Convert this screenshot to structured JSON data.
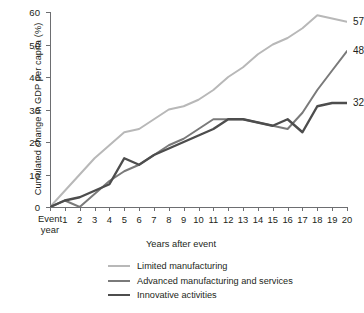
{
  "chart_data": {
    "type": "line",
    "title": "",
    "xlabel": "Years after event",
    "ylabel": "Cumulated change in GDP per capita (%)",
    "xlim": [
      0,
      20
    ],
    "ylim": [
      0,
      60
    ],
    "grid": false,
    "legend_position": "bottom",
    "x": [
      0,
      1,
      2,
      3,
      4,
      5,
      6,
      7,
      8,
      9,
      10,
      11,
      12,
      13,
      14,
      15,
      16,
      17,
      18,
      19,
      20
    ],
    "xtick_labels": [
      "Event year",
      "1",
      "2",
      "3",
      "4",
      "5",
      "6",
      "7",
      "8",
      "9",
      "10",
      "11",
      "12",
      "13",
      "14",
      "15",
      "16",
      "17",
      "18",
      "19",
      "20"
    ],
    "ytick_labels": [
      "0",
      "10",
      "20",
      "30",
      "40",
      "50",
      "60"
    ],
    "ytick_values": [
      0,
      10,
      20,
      30,
      40,
      50,
      60
    ],
    "series": [
      {
        "name": "Limited manufacturing",
        "color": "#b8b8b8",
        "width": 2.0,
        "end_label": "57",
        "values": [
          0,
          5,
          10,
          15,
          19,
          23,
          24,
          27,
          30,
          31,
          33,
          36,
          40,
          43,
          47,
          50,
          52,
          55,
          59,
          58,
          57
        ]
      },
      {
        "name": "Advanced manufacturing and services",
        "color": "#7a7a7a",
        "width": 2.0,
        "end_label": "48",
        "values": [
          0,
          2,
          0,
          4,
          8,
          11,
          13,
          16,
          19,
          21,
          24,
          27,
          27,
          27,
          26,
          25,
          24,
          29,
          36,
          42,
          48
        ]
      },
      {
        "name": "Innovative activities",
        "color": "#4d4d4d",
        "width": 2.4,
        "end_label": "32",
        "values": [
          0,
          2,
          3,
          5,
          7,
          15,
          13,
          16,
          18,
          20,
          22,
          24,
          27,
          27,
          26,
          25,
          27,
          23,
          31,
          32,
          32
        ]
      }
    ]
  },
  "legend": {
    "items": [
      {
        "label": "Limited manufacturing",
        "color": "#b8b8b8",
        "width": 2.0
      },
      {
        "label": "Advanced manufacturing and services",
        "color": "#7a7a7a",
        "width": 2.0
      },
      {
        "label": "Innovative activities",
        "color": "#4d4d4d",
        "width": 2.4
      }
    ]
  },
  "axis": {
    "event_year_line1": "Event",
    "event_year_line2": "year"
  }
}
